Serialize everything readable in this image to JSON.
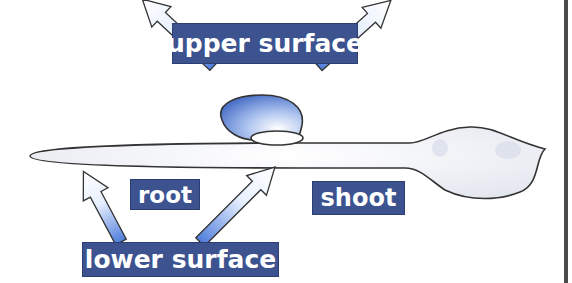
{
  "diagram": {
    "labels": {
      "upper_surface": "upper surface",
      "lower_surface": "lower surface",
      "root": "root",
      "shoot": "shoot"
    },
    "colors": {
      "label_bg": "#3c5390",
      "label_text": "#ffffff",
      "arrow_blue": "#5b86dc",
      "outline": "#333333",
      "border": "#4a4a4a"
    }
  }
}
